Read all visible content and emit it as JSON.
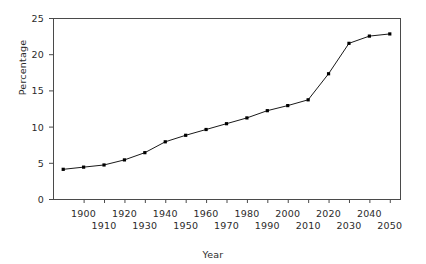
{
  "chart_data": {
    "type": "line",
    "title": "",
    "xlabel": "Year",
    "ylabel": "Percentage",
    "xlim": [
      1885,
      2055
    ],
    "ylim": [
      0,
      25
    ],
    "grid": false,
    "legend": null,
    "line_color": "#1a1a1a",
    "marker": "square",
    "marker_color": "#000000",
    "x": [
      1890,
      1900,
      1910,
      1920,
      1930,
      1940,
      1950,
      1960,
      1970,
      1980,
      1990,
      2000,
      2010,
      2020,
      2030,
      2040,
      2050
    ],
    "values": [
      4.1,
      4.4,
      4.7,
      5.4,
      6.4,
      7.9,
      8.8,
      9.6,
      10.4,
      11.2,
      12.2,
      12.9,
      13.7,
      17.3,
      21.5,
      22.5,
      22.8
    ],
    "series": [
      {
        "name": "Percentage",
        "values": [
          4.1,
          4.4,
          4.7,
          5.4,
          6.4,
          7.9,
          8.8,
          9.6,
          10.4,
          11.2,
          12.2,
          12.9,
          13.7,
          17.3,
          21.5,
          22.5,
          22.8
        ]
      }
    ],
    "yticks": [
      0,
      5,
      10,
      15,
      20,
      25
    ],
    "ytick_labels": [
      "0",
      "5",
      "10",
      "15",
      "20",
      "25"
    ],
    "xticks": [
      1900,
      1910,
      1920,
      1930,
      1940,
      1950,
      1960,
      1970,
      1980,
      1990,
      2000,
      2010,
      2020,
      2030,
      2040,
      2050
    ],
    "xtick_labels": [
      "1900",
      "1910",
      "1920",
      "1930",
      "1940",
      "1950",
      "1960",
      "1970",
      "1980",
      "1990",
      "2000",
      "2010",
      "2020",
      "2030",
      "2040",
      "2050"
    ],
    "xtick_rows": [
      1,
      0,
      1,
      0,
      1,
      0,
      1,
      0,
      1,
      0,
      1,
      0,
      1,
      0,
      1,
      0
    ]
  }
}
